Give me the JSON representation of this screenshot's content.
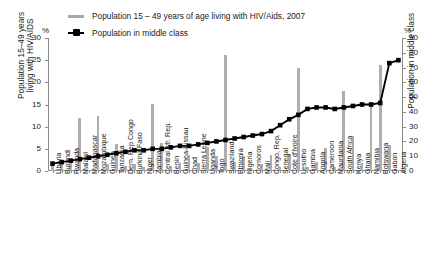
{
  "legend": {
    "items": [
      {
        "label": "Population 15 – 49 years of age living with HIV/Aids, 2007",
        "marker": "bar-swatch",
        "color": "#a8a8a8"
      },
      {
        "label": "Population in middle class",
        "marker": "line-marker-swatch",
        "color": "#000000"
      }
    ]
  },
  "axes": {
    "left_unit": "%",
    "right_unit": "%",
    "left_title": "Population 15–49 years\nliving with HIV/AIDS",
    "right_title": "Population in middle class",
    "left_ticks": [
      "0",
      "5",
      "10",
      "15",
      "20",
      "25",
      "30"
    ],
    "right_ticks": [
      "0",
      "10",
      "20",
      "30",
      "40",
      "50",
      "60",
      "70",
      "80",
      "90"
    ]
  },
  "chart_data": {
    "type": "bar",
    "title": "",
    "xlabel": "",
    "ylabel": "Population 15–49 years living with HIV/AIDS",
    "ylim": [
      0,
      30
    ],
    "y2lim": [
      0,
      90
    ],
    "y2label": "Population in middle class",
    "grid": false,
    "legend_position": "top-left",
    "categories": [
      "Liberia",
      "Burundi",
      "Rwanda",
      "Malawi",
      "Madagascar",
      "Mozambique",
      "Guinea",
      "Tanzania",
      "Dem. Rep Congo",
      "Burkina Faso",
      "Niger",
      "Zambia",
      "Central Afr. Rep.",
      "Benin",
      "Guinea-Bissau",
      "Chad",
      "Sierra Leone",
      "Uganda",
      "Togo",
      "Swaziland",
      "Ethiopia",
      "Nigeria",
      "Comoros",
      "Mali",
      "Congo, Rep.",
      "Senegal",
      "Cote d'Ivoire",
      "Lesotho",
      "Gambia",
      "Angola",
      "Cameroon",
      "Mauritania",
      "South Africa",
      "Kenya",
      "Ghana",
      "Namibia",
      "Botswana",
      "Gabon",
      "Algeria"
    ],
    "series": [
      {
        "name": "Population 15 – 49 years of age living with HIV/Aids, 2007",
        "type": "bar",
        "axis": "left",
        "unit": "%",
        "color": "#aeaeae",
        "values": [
          1.7,
          2.0,
          2.8,
          11.9,
          0.1,
          12.5,
          1.6,
          6.2,
          1.2,
          1.6,
          0.8,
          15.2,
          6.3,
          1.2,
          1.8,
          3.5,
          1.7,
          5.4,
          3.3,
          26.1,
          2.1,
          3.1,
          0.1,
          1.5,
          3.5,
          1.0,
          3.9,
          23.2,
          0.9,
          2.1,
          5.1,
          0.8,
          18.1,
          7.8,
          1.9,
          15.3,
          23.9,
          5.9,
          0.1
        ]
      },
      {
        "name": "Population in middle class",
        "type": "line",
        "axis": "right",
        "unit": "%",
        "color": "#000000",
        "values": [
          5,
          6,
          7,
          8,
          9,
          10,
          11,
          12,
          13,
          14,
          14,
          15,
          15,
          16,
          17,
          17,
          18,
          19,
          20,
          21,
          22,
          23,
          24,
          25,
          27,
          31,
          35,
          38,
          42,
          43,
          43,
          42,
          43,
          44,
          45,
          45,
          46,
          73,
          75
        ]
      }
    ]
  }
}
